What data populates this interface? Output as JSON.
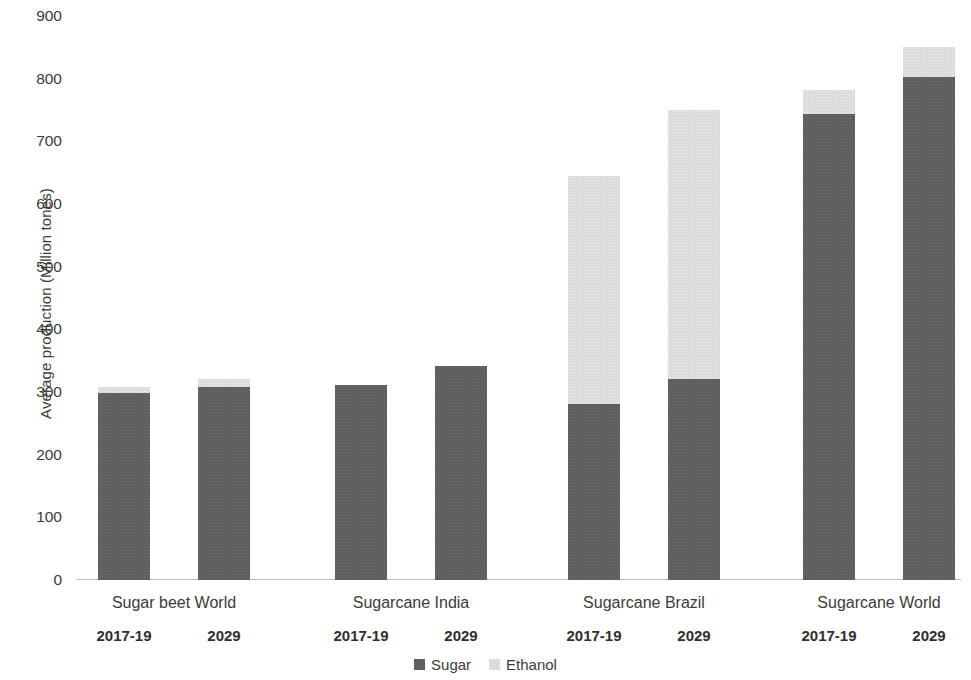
{
  "chart_data": {
    "type": "bar",
    "subtype": "stacked-bar-grouped",
    "title": "",
    "xlabel": "",
    "ylabel": "Average production (Million tones)",
    "ylim": [
      0,
      900
    ],
    "y_ticks": [
      900,
      800,
      700,
      600,
      500,
      400,
      300,
      200,
      100,
      0
    ],
    "grid": false,
    "legend_position": "bottom-center",
    "groups": [
      "Sugar beet World",
      "Sugarcane India",
      "Sugarcane Brazil",
      "Sugarcane World"
    ],
    "categories": [
      "Sugar beet World 2017-19",
      "Sugar beet World 2029",
      "Sugarcane India 2017-19",
      "Sugarcane India 2029",
      "Sugarcane Brazil 2017-19",
      "Sugarcane Brazil 2029",
      "Sugarcane World 2017-19",
      "Sugarcane World 2029"
    ],
    "periods": [
      "2017-19",
      "2029",
      "2017-19",
      "2029",
      "2017-19",
      "2029",
      "2017-19",
      "2029"
    ],
    "series": [
      {
        "name": "Sugar",
        "color": "#5f5f5f",
        "values": [
          298,
          308,
          311,
          341,
          281,
          321,
          744,
          803
        ]
      },
      {
        "name": "Ethanol",
        "color": "#dcdcdc",
        "values": [
          10,
          13,
          0,
          0,
          364,
          429,
          38,
          47
        ]
      }
    ],
    "totals": [
      308,
      321,
      311,
      341,
      645,
      750,
      782,
      850
    ]
  },
  "legend": {
    "items": [
      {
        "label": "Sugar",
        "swatch": "sugar"
      },
      {
        "label": "Ethanol",
        "swatch": "ethanol"
      }
    ]
  }
}
